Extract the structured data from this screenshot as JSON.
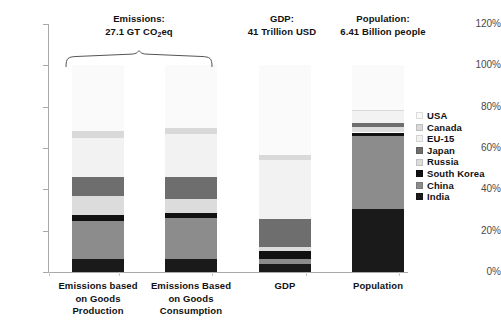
{
  "chart_data": {
    "type": "bar",
    "subtype": "stacked-100-percent",
    "title": "",
    "xlabel": "",
    "ylabel": "",
    "ylim": [
      0,
      120
    ],
    "ytick_labels": [
      "0%",
      "20%",
      "40%",
      "60%",
      "80%",
      "100%",
      "120%"
    ],
    "ytick_values": [
      0,
      20,
      40,
      60,
      80,
      100,
      120
    ],
    "grid": false,
    "legend_position": "right",
    "categories": [
      "Emissions based on Goods Production",
      "Emissions Based on Goods Consumption",
      "GDP",
      "Population"
    ],
    "series": [
      {
        "name": "India",
        "color": "#1a1a1a",
        "values": [
          6.5,
          6.5,
          4.0,
          30.5
        ]
      },
      {
        "name": "China",
        "color": "#8c8c8c",
        "values": [
          18.0,
          19.5,
          2.5,
          35.5
        ]
      },
      {
        "name": "South Korea",
        "color": "#111111",
        "values": [
          3.0,
          2.5,
          3.5,
          1.5
        ]
      },
      {
        "name": "Russia",
        "color": "#dcdcdc",
        "values": [
          9.5,
          7.0,
          2.0,
          2.5
        ]
      },
      {
        "name": "Japan",
        "color": "#6e6e6e",
        "values": [
          9.0,
          10.5,
          13.5,
          2.0
        ]
      },
      {
        "name": "EU-15",
        "color": "#f2f2f2",
        "values": [
          19.0,
          21.0,
          28.5,
          6.0
        ]
      },
      {
        "name": "Canada",
        "color": "#d9d9d9",
        "values": [
          3.0,
          2.5,
          2.5,
          0.5
        ]
      },
      {
        "name": "USA",
        "color": "#fafafa",
        "values": [
          32.0,
          30.5,
          43.5,
          21.5
        ]
      }
    ]
  },
  "annotations": {
    "group_emissions": {
      "line1": "Emissions:",
      "line2_pre": "27.1 GT CO",
      "line2_sub": "2",
      "line2_post": "eq"
    },
    "group_gdp": {
      "line1": "GDP:",
      "line2": "41 Trillion USD"
    },
    "group_population": {
      "line1": "Population:",
      "line2": "6.41 Billion people"
    }
  },
  "axis": {
    "y_labels": [
      "120%",
      "100%",
      "80%",
      "60%",
      "40%",
      "20%",
      "0%"
    ]
  },
  "x_labels": [
    {
      "l1": "Emissions based",
      "l2": "on Goods",
      "l3": "Production"
    },
    {
      "l1": "Emissions Based",
      "l2": "on Goods",
      "l3": "Consumption"
    },
    {
      "l1": "GDP",
      "l2": "",
      "l3": ""
    },
    {
      "l1": "Population",
      "l2": "",
      "l3": ""
    }
  ],
  "legend": {
    "items": [
      {
        "label": "USA",
        "color": "#fafafa"
      },
      {
        "label": "Canada",
        "color": "#d9d9d9"
      },
      {
        "label": "EU-15",
        "color": "#f2f2f2"
      },
      {
        "label": "Japan",
        "color": "#6e6e6e"
      },
      {
        "label": "Russia",
        "color": "#dcdcdc"
      },
      {
        "label": "South Korea",
        "color": "#111111"
      },
      {
        "label": "China",
        "color": "#8c8c8c"
      },
      {
        "label": "India",
        "color": "#1a1a1a"
      }
    ]
  }
}
